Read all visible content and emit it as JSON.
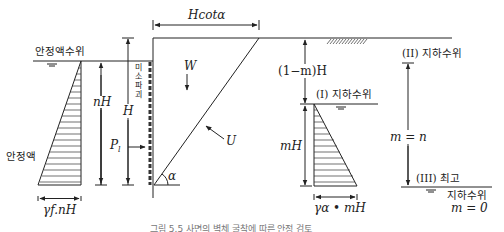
{
  "diagram": {
    "labels": {
      "slurry_level": "안정액수위",
      "slurry": "안정액",
      "n_h": "nH",
      "h": "H",
      "h_cot_alpha": "Hcotα",
      "weight": "W",
      "uplift": "U",
      "pressure": "P",
      "pressure_sub": "l",
      "alpha": "α",
      "one_minus_m_h": "(1−m)H",
      "m_h": "mH",
      "gw_level_1": "(I) 지하수위",
      "gw_level_2": "(II) 지하수위",
      "gw_level_3_top": "(III) 최고",
      "gw_level_3_bottom": "지하수위",
      "m_equals_n": "m = n",
      "m_equals_0": "m = 0",
      "slurry_pressure_base": "γf.nH",
      "water_pressure_base": "γα • mH",
      "wall_vertical_text": [
        "미",
        "소",
        "파",
        "괴",
        "면"
      ]
    },
    "caption": "그림 5.5 사면의 벽체 굴착에 따른 안정 검토"
  }
}
